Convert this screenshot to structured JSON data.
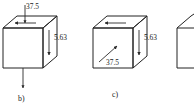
{
  "figure": {
    "background_color": "#ffffff",
    "line_color": "#222222",
    "text_color": "#1a1a1a",
    "panels": [
      {
        "id": "panel-b",
        "caption": "b)",
        "top_label": "37.5",
        "right_label": "5.63",
        "arrows": [
          {
            "name": "top-face-arrow-left",
            "direction": "left",
            "face": "top"
          },
          {
            "name": "top-label-arrow-down",
            "direction": "down",
            "face": "top"
          },
          {
            "name": "right-face-arrow-down",
            "direction": "down",
            "face": "right"
          },
          {
            "name": "bottom-arrow-down",
            "direction": "down",
            "face": "below"
          }
        ]
      },
      {
        "id": "panel-c",
        "caption": "c)",
        "front_label": "37.5",
        "right_label": "5.63",
        "arrows": [
          {
            "name": "top-face-arrow-left",
            "direction": "left",
            "face": "top"
          },
          {
            "name": "front-face-arrow-diagonal",
            "direction": "up-right",
            "face": "front"
          },
          {
            "name": "right-face-arrow-down",
            "direction": "down",
            "face": "right"
          }
        ]
      },
      {
        "id": "panel-d-partial",
        "caption": "",
        "note": "cube clipped at right edge of image"
      }
    ]
  }
}
